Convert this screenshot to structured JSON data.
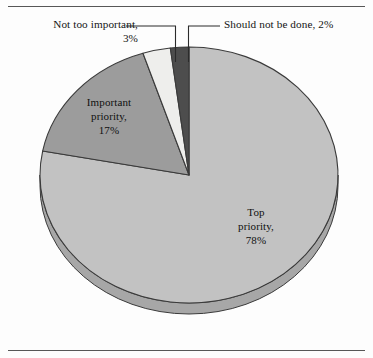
{
  "figure": {
    "background": "#fdfdfd",
    "has_top_rule": true,
    "has_bottom_rule": true,
    "rule_color": "#575757"
  },
  "callouts": {
    "not_too_important": "Not too important,\n3%",
    "should_not_be_done": "Should not be done, 2%"
  },
  "slice_labels": {
    "important_priority": "Important\npriority,\n17%",
    "top_priority": "Top\npriority,\n78%"
  },
  "chart_data": {
    "type": "pie",
    "title": "",
    "subtitle": "",
    "xlabel": "",
    "ylabel": "",
    "legend_position": "none",
    "grid": false,
    "start_angle_deg": -90,
    "direction": "clockwise",
    "three_d": true,
    "depth_px": 11,
    "center": {
      "x": 189,
      "y": 175
    },
    "radius": {
      "rx": 149,
      "ry": 128
    },
    "categories": [
      "Top priority",
      "Important priority",
      "Not too important",
      "Should not be done"
    ],
    "values": [
      78,
      17,
      3,
      2
    ],
    "value_suffix": "%",
    "colors": [
      "#c2c2c2",
      "#9c9c9c",
      "#eeeeec",
      "#4d4d4d"
    ],
    "edge_color": "#3a3a3a",
    "slices": [
      {
        "label": "Top priority",
        "value": 78,
        "color": "#c2c2c2",
        "label_placement": "inside"
      },
      {
        "label": "Important priority",
        "value": 17,
        "color": "#9c9c9c",
        "label_placement": "inside"
      },
      {
        "label": "Not too important",
        "value": 3,
        "color": "#eeeeec",
        "label_placement": "callout-left"
      },
      {
        "label": "Should not be done",
        "value": 2,
        "color": "#4d4d4d",
        "label_placement": "callout-right"
      }
    ],
    "annotations": [
      "Not too important, 3%",
      "Should not be done, 2%",
      "Important priority, 17%",
      "Top priority, 78%"
    ]
  }
}
